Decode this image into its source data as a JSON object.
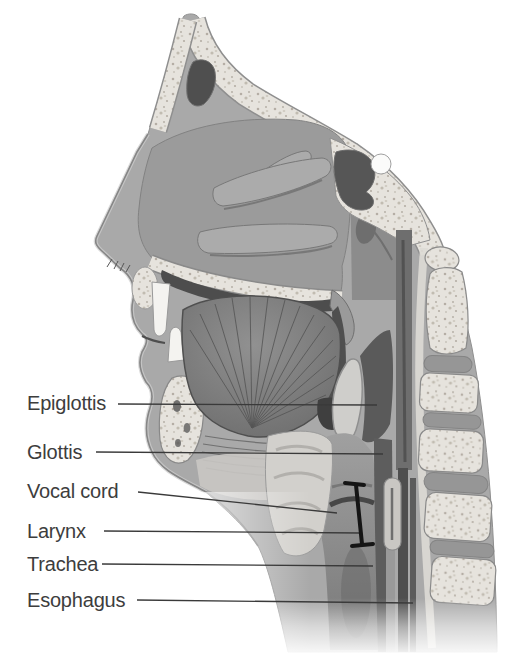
{
  "labels": [
    {
      "id": "epiglottis",
      "text": "Epiglottis"
    },
    {
      "id": "glottis",
      "text": "Glottis"
    },
    {
      "id": "vocal-cord",
      "text": "Vocal cord"
    },
    {
      "id": "larynx",
      "text": "Larynx"
    },
    {
      "id": "trachea",
      "text": "Trachea"
    },
    {
      "id": "esophagus",
      "text": "Esophagus"
    }
  ],
  "colors": {
    "label_text": "#3d3d3d",
    "leader_line": "#3a3a3a",
    "bracket": "#151515",
    "bone": "#e6e3dd",
    "soft_tissue": "#a9a9a9",
    "cavity": "#4f4f4f"
  }
}
